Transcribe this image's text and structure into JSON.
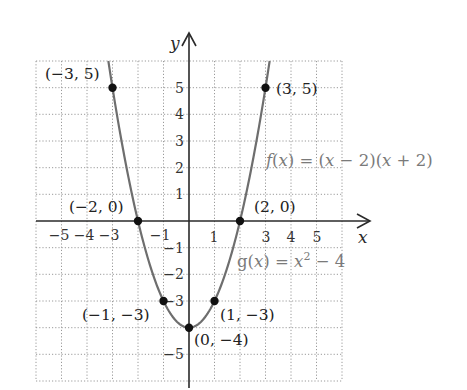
{
  "chart_data": {
    "type": "line",
    "title": "",
    "xlabel": "x",
    "ylabel": "y",
    "xlim": [
      -6,
      6
    ],
    "ylim": [
      -6,
      6
    ],
    "grid": true,
    "x_ticks": [
      -5,
      -4,
      -3,
      -1,
      1,
      3,
      4,
      5
    ],
    "y_ticks": [
      5,
      4,
      3,
      2,
      1,
      -1,
      -2,
      -3,
      -5
    ],
    "series": [
      {
        "name": "f(x) = (x − 2)(x + 2)",
        "alias": "g(x) = x² − 4",
        "function": "x^2 - 4",
        "color": "#6e6e6e"
      }
    ],
    "points": [
      {
        "x": -3,
        "y": 5,
        "label": "(−3, 5)"
      },
      {
        "x": 3,
        "y": 5,
        "label": "(3, 5)"
      },
      {
        "x": -2,
        "y": 0,
        "label": "(−2, 0)"
      },
      {
        "x": 2,
        "y": 0,
        "label": "(2, 0)"
      },
      {
        "x": -1,
        "y": -3,
        "label": "(−1, −3)"
      },
      {
        "x": 1,
        "y": -3,
        "label": "(1, −3)"
      },
      {
        "x": 0,
        "y": -4,
        "label": "(0, −4)"
      }
    ],
    "annotations": [
      "f(x) = (x − 2)(x + 2)",
      "g(x) = x² − 4"
    ]
  },
  "labels": {
    "x_axis": "x",
    "y_axis": "y",
    "x_ticks": {
      "m5": "−5",
      "m4": "−4",
      "m3": "−3",
      "m1": "−1",
      "p1": "1",
      "p3": "3",
      "p4": "4",
      "p5": "5"
    },
    "y_ticks": {
      "p5": "5",
      "p4": "4",
      "p3": "3",
      "p2": "2",
      "p1": "1",
      "m1": "−1",
      "m2": "−2",
      "m3": "−3",
      "m5": "−5"
    },
    "points": {
      "p_m3_5": "(−3, 5)",
      "p_3_5": "(3, 5)",
      "p_m2_0": "(−2, 0)",
      "p_2_0": "(2, 0)",
      "p_m1_m3": "(−1, −3)",
      "p_1_m3": "(1, −3)",
      "p_0_m4": "(0, −4)"
    },
    "f_label": {
      "f": "f",
      "open1": "(",
      "x1": "x",
      "mid": ") = (",
      "x2": "x",
      "rest1": " − 2)(",
      "x3": "x",
      "rest2": " + 2)"
    },
    "g_label": {
      "g": "g(",
      "x1": "x",
      "mid": ") = ",
      "x2": "x",
      "exp": "2",
      "rest": " − 4"
    }
  }
}
